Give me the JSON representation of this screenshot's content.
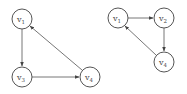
{
  "diagram": {
    "graphs": [
      {
        "name": "left-graph",
        "nodes": [
          {
            "id": "v1",
            "base": "v",
            "sub": "1",
            "x": 22,
            "y": 19
          },
          {
            "id": "v3",
            "base": "v",
            "sub": "3",
            "x": 22,
            "y": 77
          },
          {
            "id": "v4",
            "base": "v",
            "sub": "4",
            "x": 90,
            "y": 77
          }
        ],
        "edges": [
          {
            "from": "v1",
            "to": "v3"
          },
          {
            "from": "v3",
            "to": "v4"
          },
          {
            "from": "v4",
            "to": "v1"
          }
        ]
      },
      {
        "name": "right-graph",
        "nodes": [
          {
            "id": "v1",
            "base": "v",
            "sub": "1",
            "x": 118,
            "y": 18
          },
          {
            "id": "v2",
            "base": "v",
            "sub": "2",
            "x": 164,
            "y": 18
          },
          {
            "id": "v4",
            "base": "v",
            "sub": "4",
            "x": 164,
            "y": 62
          }
        ],
        "edges": [
          {
            "from": "v1",
            "to": "v2"
          },
          {
            "from": "v2",
            "to": "v4"
          },
          {
            "from": "v4",
            "to": "v1"
          }
        ]
      }
    ],
    "labels": {
      "g1_v1_base": "v",
      "g1_v1_sub": "1",
      "g1_v3_base": "v",
      "g1_v3_sub": "3",
      "g1_v4_base": "v",
      "g1_v4_sub": "4",
      "g2_v1_base": "v",
      "g2_v1_sub": "1",
      "g2_v2_base": "v",
      "g2_v2_sub": "2",
      "g2_v4_base": "v",
      "g2_v4_sub": "4"
    }
  }
}
